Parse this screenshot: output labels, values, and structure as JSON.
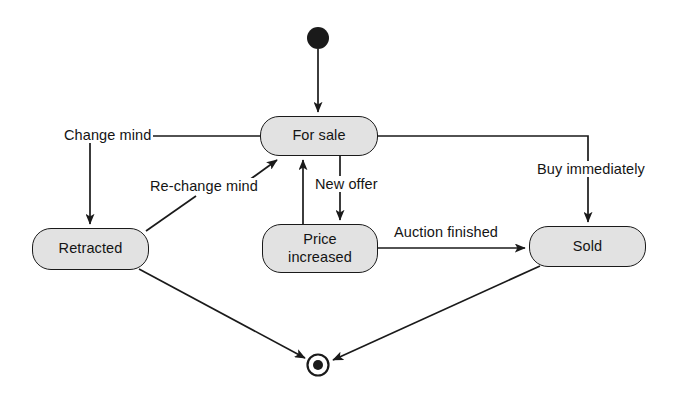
{
  "diagram": {
    "type": "uml-state-machine",
    "colors": {
      "state_fill": "#e2e2e2",
      "stroke": "#1a1a1a",
      "text": "#141414",
      "background": "#ffffff"
    },
    "initial_state": {
      "name": "initial-state",
      "cx": 318,
      "cy": 38,
      "r": 11
    },
    "final_state": {
      "name": "final-state",
      "cx": 318,
      "cy": 365,
      "outer_r": 11,
      "inner_r": 5
    },
    "states": [
      {
        "id": "for_sale",
        "label": "For sale",
        "x": 260,
        "y": 116,
        "w": 118,
        "h": 40
      },
      {
        "id": "retracted",
        "label": "Retracted",
        "x": 32,
        "y": 228,
        "w": 117,
        "h": 42
      },
      {
        "id": "price_increased",
        "label": "Price\nincreased",
        "x": 262,
        "y": 224,
        "w": 116,
        "h": 49
      },
      {
        "id": "sold",
        "label": "Sold",
        "x": 529,
        "y": 226,
        "w": 117,
        "h": 41
      }
    ],
    "transitions": [
      {
        "id": "t_start",
        "label": "",
        "from": "initial",
        "to": "for_sale"
      },
      {
        "id": "t_change_mind",
        "label": "Change mind",
        "from": "for_sale",
        "to": "retracted",
        "label_x": 62,
        "label_y": 127
      },
      {
        "id": "t_rechange_mind",
        "label": "Re-change mind",
        "from": "retracted",
        "to": "for_sale",
        "label_x": 148,
        "label_y": 178
      },
      {
        "id": "t_new_offer",
        "label": "New offer",
        "from": "for_sale",
        "to": "price_increased",
        "label_x": 313,
        "label_y": 176
      },
      {
        "id": "t_price_up",
        "label": "",
        "from": "price_increased",
        "to": "for_sale"
      },
      {
        "id": "t_auction_finished",
        "label": "Auction finished",
        "from": "price_increased",
        "to": "sold",
        "label_x": 392,
        "label_y": 224
      },
      {
        "id": "t_buy_immediately",
        "label": "Buy immediately",
        "from": "for_sale",
        "to": "sold",
        "label_x": 535,
        "label_y": 161
      },
      {
        "id": "t_retracted_end",
        "label": "",
        "from": "retracted",
        "to": "final"
      },
      {
        "id": "t_sold_end",
        "label": "",
        "from": "sold",
        "to": "final"
      }
    ]
  }
}
